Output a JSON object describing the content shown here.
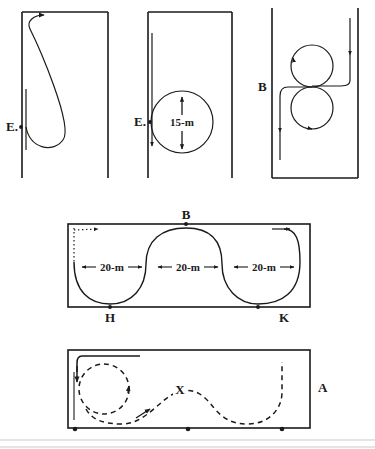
{
  "figure": {
    "background_color": "#ffffff",
    "ink_color": "#1a1a1a",
    "panels": [
      {
        "id": "panel-top-left",
        "name": "teardrop-turn-panel",
        "labels": [
          {
            "name": "label-E",
            "text": "E."
          }
        ],
        "description": "Teardrop / loop turn starting at point E on the left lane line, curving down and back up to the top with an arrow."
      },
      {
        "id": "panel-top-middle",
        "name": "circle-turn-panel",
        "labels": [
          {
            "name": "label-E",
            "text": "E."
          },
          {
            "name": "label-diameter",
            "text": "15-m"
          },
          {
            "name": "arrow-up-glyph",
            "text": "↑"
          },
          {
            "name": "arrow-down-glyph",
            "text": "↓"
          }
        ],
        "description": "A 15-m diameter circle tangent to the left lane line at point E with up and down arrows marking the diameter."
      },
      {
        "id": "panel-top-right",
        "name": "figure-eight-panel",
        "labels": [
          {
            "name": "label-B",
            "text": "B"
          }
        ],
        "description": "Figure-eight maneuver of two tangent circles entered from the right lane and exiting down the left at point B."
      },
      {
        "id": "panel-middle",
        "name": "serpentine-panel",
        "labels": [
          {
            "name": "label-B",
            "text": "B"
          },
          {
            "name": "label-H",
            "text": "H"
          },
          {
            "name": "label-K",
            "text": "K"
          },
          {
            "name": "dimension-1",
            "text": "20-m"
          },
          {
            "name": "dimension-2",
            "text": "20-m"
          },
          {
            "name": "dimension-3",
            "text": "20-m"
          },
          {
            "name": "arrow-left-glyph",
            "text": "←"
          },
          {
            "name": "arrow-right-glyph",
            "text": "→"
          }
        ],
        "dimensions": [
          "20-m",
          "20-m",
          "20-m"
        ],
        "description": "Serpentine / slalom course in a rectangle, three 20-m sections, apex at B on top edge, points H and K on the bottom edge."
      },
      {
        "id": "panel-bottom",
        "name": "dashed-course-panel",
        "labels": [
          {
            "name": "label-X",
            "text": "X"
          },
          {
            "name": "label-A",
            "text": "A"
          }
        ],
        "description": "Dashed vehicle path: a full circle at the left, then an S-curve through point X, ending at a dashed vertical line near A on the right; three dot markers on the bottom edge."
      }
    ]
  }
}
